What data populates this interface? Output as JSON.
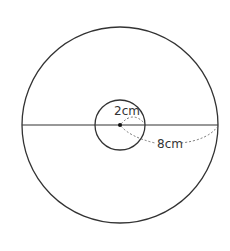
{
  "diagram": {
    "type": "concentric-circles",
    "outer_circle": {
      "cx": 120,
      "cy": 125,
      "r": 98
    },
    "inner_circle": {
      "cx": 120,
      "cy": 125,
      "r": 25
    },
    "labels": {
      "inner_radius": "2cm",
      "outer_radius": "8cm"
    },
    "colors": {
      "stroke": "#333333",
      "dashed": "#666666",
      "background": "#ffffff"
    }
  }
}
